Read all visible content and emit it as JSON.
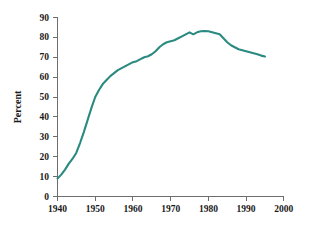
{
  "chart_data": {
    "type": "line",
    "title": "",
    "subtitle": "",
    "xlabel": "",
    "ylabel": "Percent",
    "xlim": [
      1940,
      2000
    ],
    "ylim": [
      0,
      90
    ],
    "grid": false,
    "legend": null,
    "legend_position": "none",
    "xticks": [
      1940,
      1950,
      1960,
      1970,
      1980,
      1990,
      2000
    ],
    "xtick_labels": [
      "1940",
      "1950",
      "1960",
      "1970",
      "1980",
      "1990",
      "2000"
    ],
    "yticks": [
      0,
      10,
      20,
      30,
      40,
      50,
      60,
      70,
      80,
      90
    ],
    "ytick_labels": [
      "0",
      "10",
      "20",
      "30",
      "40",
      "50",
      "60",
      "70",
      "80",
      "90"
    ],
    "series": [
      {
        "name": "Percent",
        "color": "#2b8a80",
        "x": [
          1940,
          1941,
          1942,
          1943,
          1944,
          1945,
          1946,
          1947,
          1948,
          1949,
          1950,
          1951,
          1952,
          1953,
          1954,
          1955,
          1956,
          1957,
          1958,
          1959,
          1960,
          1961,
          1962,
          1963,
          1964,
          1965,
          1966,
          1967,
          1968,
          1969,
          1970,
          1971,
          1972,
          1973,
          1974,
          1975,
          1976,
          1977,
          1978,
          1979,
          1980,
          1981,
          1982,
          1983,
          1984,
          1985,
          1986,
          1987,
          1988,
          1989,
          1990,
          1991,
          1992,
          1993,
          1994,
          1995
        ],
        "values": [
          9,
          11,
          13.5,
          16.5,
          19,
          22,
          27,
          32.5,
          38.5,
          44.5,
          50,
          53.5,
          56.5,
          58.5,
          60.5,
          62,
          63.5,
          64.5,
          65.5,
          66.5,
          67.5,
          68,
          69,
          70,
          70.5,
          71.5,
          73,
          75,
          76.5,
          77.5,
          78,
          78.5,
          79.5,
          80.5,
          81.5,
          82.5,
          81.5,
          82.5,
          83,
          83.2,
          83,
          82.5,
          82,
          81.5,
          79.5,
          77.5,
          76,
          75,
          74,
          73.5,
          73,
          72.5,
          72,
          71.5,
          70.8,
          70.3
        ]
      }
    ]
  },
  "axes": {
    "ylabel_text": "Percent"
  }
}
